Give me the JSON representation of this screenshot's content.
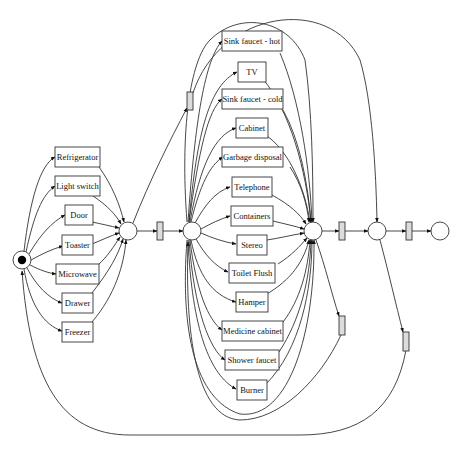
{
  "diagram": {
    "type": "petri-net",
    "colors": {
      "stroke": "#333333",
      "tau_fill": "#dcdcdc",
      "background": "#ffffff",
      "token": "#000000"
    },
    "places": [
      {
        "id": "start",
        "marked": true
      },
      {
        "id": "p1",
        "marked": false
      },
      {
        "id": "p2",
        "marked": false
      },
      {
        "id": "p3",
        "marked": false
      },
      {
        "id": "p4",
        "marked": false
      },
      {
        "id": "end",
        "marked": false
      }
    ],
    "left_activities": [
      {
        "label": "Refrigerator"
      },
      {
        "label": "Light switch"
      },
      {
        "label": "Door"
      },
      {
        "label": "Toaster"
      },
      {
        "label": "Microwave"
      },
      {
        "label": "Drawer"
      },
      {
        "label": "Freezer"
      }
    ],
    "middle_activities": [
      {
        "label": "Sink faucet - hot"
      },
      {
        "label": "TV"
      },
      {
        "label": "Sink faucet - cold"
      },
      {
        "label": "Cabinet"
      },
      {
        "label": "Garbage disposal"
      },
      {
        "label": "Telephone"
      },
      {
        "label": "Containers"
      },
      {
        "label": "Stereo"
      },
      {
        "label": "Toilet Flush"
      },
      {
        "label": "Hamper"
      },
      {
        "label": "Medicine cabinet"
      },
      {
        "label": "Shower faucet"
      },
      {
        "label": "Burner"
      }
    ],
    "silent_transitions": [
      {
        "id": "tau-skip-upper"
      },
      {
        "id": "tau-p1-p2"
      },
      {
        "id": "tau-p3-p4"
      },
      {
        "id": "tau-p4-end"
      },
      {
        "id": "tau-loop-middle"
      },
      {
        "id": "tau-loop-start"
      }
    ]
  }
}
